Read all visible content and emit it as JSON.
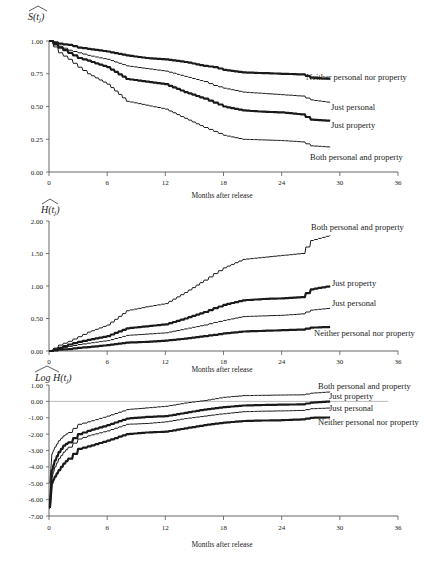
{
  "chart_data": [
    {
      "type": "line",
      "title": "",
      "ylabel": "S(t_j) hat",
      "xlabel": "Months after release",
      "xlim": [
        0,
        36
      ],
      "ylim": [
        0,
        1
      ],
      "xticks": [
        0,
        6,
        12,
        18,
        24,
        30,
        36
      ],
      "yticks": [
        0.0,
        0.25,
        0.5,
        0.75,
        1.0
      ],
      "ytick_labels": [
        "0.00",
        "0.25",
        "0.50",
        "0.75",
        "1.00"
      ],
      "grid": false,
      "legend": "inline labels at line ends",
      "series": [
        {
          "name": "Neither personal nor property",
          "weight": "thick",
          "x": [
            0,
            1,
            2,
            3,
            4,
            6,
            8,
            10,
            12,
            14,
            16,
            17,
            18,
            20,
            22,
            24,
            26,
            27,
            29
          ],
          "y": [
            1.0,
            0.98,
            0.97,
            0.95,
            0.94,
            0.92,
            0.89,
            0.87,
            0.86,
            0.84,
            0.81,
            0.8,
            0.78,
            0.76,
            0.755,
            0.75,
            0.745,
            0.72,
            0.71
          ]
        },
        {
          "name": "Just personal",
          "weight": "thin",
          "x": [
            0,
            1,
            2,
            3,
            4,
            6,
            8,
            10,
            12,
            14,
            16,
            17,
            18,
            20,
            22,
            24,
            26,
            27,
            29
          ],
          "y": [
            1.0,
            0.96,
            0.93,
            0.91,
            0.89,
            0.86,
            0.81,
            0.79,
            0.77,
            0.73,
            0.69,
            0.66,
            0.64,
            0.61,
            0.6,
            0.59,
            0.58,
            0.55,
            0.53
          ]
        },
        {
          "name": "Just property",
          "weight": "thick",
          "x": [
            0,
            1,
            2,
            3,
            4,
            6,
            8,
            10,
            12,
            14,
            16,
            17,
            18,
            20,
            22,
            24,
            26,
            27,
            29
          ],
          "y": [
            1.0,
            0.95,
            0.91,
            0.87,
            0.85,
            0.8,
            0.71,
            0.69,
            0.67,
            0.61,
            0.56,
            0.53,
            0.5,
            0.47,
            0.46,
            0.455,
            0.44,
            0.4,
            0.39
          ]
        },
        {
          "name": "Both personal and property",
          "weight": "thin",
          "x": [
            0,
            1,
            2,
            3,
            4,
            6,
            8,
            10,
            12,
            14,
            16,
            17,
            18,
            20,
            22,
            24,
            26,
            27,
            29
          ],
          "y": [
            1.0,
            0.91,
            0.86,
            0.8,
            0.75,
            0.67,
            0.54,
            0.51,
            0.48,
            0.41,
            0.34,
            0.31,
            0.28,
            0.25,
            0.245,
            0.24,
            0.23,
            0.2,
            0.19
          ]
        }
      ]
    },
    {
      "type": "line",
      "title": "",
      "ylabel": "H(t_j) hat",
      "xlabel": "Months after release",
      "xlim": [
        0,
        36
      ],
      "ylim": [
        0,
        2
      ],
      "xticks": [
        0,
        6,
        12,
        18,
        24,
        30,
        36
      ],
      "yticks": [
        0.0,
        0.5,
        1.0,
        1.5,
        2.0
      ],
      "ytick_labels": [
        "0.00",
        "0.50",
        "1.00",
        "1.50",
        "2.00"
      ],
      "grid": false,
      "legend": "inline labels at line ends",
      "series": [
        {
          "name": "Both personal and property",
          "weight": "thin",
          "x": [
            0,
            1,
            2,
            3,
            4,
            6,
            8,
            10,
            12,
            14,
            16,
            17,
            18,
            20,
            22,
            24,
            26,
            27,
            29
          ],
          "y": [
            0.0,
            0.09,
            0.15,
            0.22,
            0.29,
            0.4,
            0.62,
            0.68,
            0.73,
            0.9,
            1.09,
            1.19,
            1.28,
            1.41,
            1.44,
            1.47,
            1.5,
            1.7,
            1.78
          ]
        },
        {
          "name": "Just property",
          "weight": "thick",
          "x": [
            0,
            1,
            2,
            3,
            4,
            6,
            8,
            10,
            12,
            14,
            16,
            17,
            18,
            20,
            22,
            24,
            26,
            27,
            29
          ],
          "y": [
            0.0,
            0.05,
            0.1,
            0.14,
            0.17,
            0.23,
            0.35,
            0.38,
            0.41,
            0.5,
            0.6,
            0.66,
            0.71,
            0.78,
            0.8,
            0.81,
            0.83,
            0.95,
            1.0
          ]
        },
        {
          "name": "Just personal",
          "weight": "thin",
          "x": [
            0,
            1,
            2,
            3,
            4,
            6,
            8,
            10,
            12,
            14,
            16,
            17,
            18,
            20,
            22,
            24,
            26,
            27,
            29
          ],
          "y": [
            0.0,
            0.04,
            0.07,
            0.1,
            0.12,
            0.16,
            0.24,
            0.26,
            0.28,
            0.34,
            0.4,
            0.44,
            0.47,
            0.53,
            0.54,
            0.55,
            0.57,
            0.63,
            0.66
          ]
        },
        {
          "name": "Neither personal nor property",
          "weight": "thick",
          "x": [
            0,
            1,
            2,
            3,
            4,
            6,
            8,
            10,
            12,
            14,
            16,
            17,
            18,
            20,
            22,
            24,
            26,
            27,
            29
          ],
          "y": [
            0.0,
            0.02,
            0.03,
            0.05,
            0.06,
            0.09,
            0.13,
            0.14,
            0.16,
            0.19,
            0.23,
            0.25,
            0.27,
            0.3,
            0.31,
            0.32,
            0.33,
            0.36,
            0.37
          ]
        }
      ]
    },
    {
      "type": "line",
      "title": "",
      "ylabel": "Log H(t_j) hat",
      "xlabel": "Months after release",
      "xlim": [
        0,
        36
      ],
      "ylim": [
        -7,
        1
      ],
      "xticks": [
        0,
        6,
        12,
        18,
        24,
        30,
        36
      ],
      "yticks": [
        -7,
        -6,
        -5,
        -4,
        -3,
        -2,
        -1,
        0,
        1
      ],
      "ytick_labels": [
        "-7.00",
        "-6.00",
        "-5.00",
        "-4.00",
        "-3.00",
        "-2.00",
        "-1.00",
        "0.00",
        "1.00"
      ],
      "reference_line": 0,
      "grid": false,
      "legend": "inline labels at line ends",
      "series": [
        {
          "name": "Both personal and property",
          "weight": "thin",
          "x": [
            0.1,
            0.3,
            0.6,
            1,
            1.5,
            2,
            3,
            4,
            6,
            8,
            10,
            12,
            14,
            16,
            18,
            20,
            22,
            24,
            26,
            27,
            29
          ],
          "y": [
            -5.0,
            -3.2,
            -2.8,
            -2.4,
            -2.1,
            -1.9,
            -1.4,
            -1.25,
            -0.9,
            -0.5,
            -0.4,
            -0.3,
            -0.1,
            0.05,
            0.25,
            0.35,
            0.37,
            0.39,
            0.4,
            0.5,
            0.58
          ]
        },
        {
          "name": "Just property",
          "weight": "thick",
          "x": [
            0.1,
            0.3,
            0.6,
            1,
            1.5,
            2,
            3,
            4,
            6,
            8,
            10,
            12,
            14,
            16,
            18,
            20,
            22,
            24,
            26,
            27,
            29
          ],
          "y": [
            -6.4,
            -4.2,
            -3.6,
            -3.1,
            -2.7,
            -2.5,
            -2.0,
            -1.8,
            -1.45,
            -1.05,
            -0.95,
            -0.9,
            -0.7,
            -0.5,
            -0.35,
            -0.25,
            -0.22,
            -0.2,
            -0.18,
            -0.08,
            0.0
          ]
        },
        {
          "name": "Just personal",
          "weight": "thin",
          "x": [
            0.1,
            0.3,
            0.6,
            1,
            1.5,
            2,
            3,
            4,
            6,
            8,
            10,
            12,
            14,
            16,
            18,
            20,
            22,
            24,
            26,
            27,
            29
          ],
          "y": [
            -6.2,
            -4.6,
            -4.0,
            -3.5,
            -3.1,
            -2.8,
            -2.3,
            -2.1,
            -1.8,
            -1.4,
            -1.35,
            -1.25,
            -1.05,
            -0.9,
            -0.75,
            -0.63,
            -0.6,
            -0.58,
            -0.55,
            -0.45,
            -0.4
          ]
        },
        {
          "name": "Neither personal nor property",
          "weight": "thick",
          "x": [
            0.1,
            0.3,
            0.6,
            1,
            1.5,
            2,
            3,
            4,
            6,
            8,
            10,
            12,
            14,
            16,
            18,
            20,
            22,
            24,
            26,
            27,
            29
          ],
          "y": [
            -6.5,
            -5.0,
            -4.6,
            -4.2,
            -3.8,
            -3.5,
            -2.9,
            -2.75,
            -2.4,
            -2.0,
            -1.9,
            -1.85,
            -1.65,
            -1.45,
            -1.3,
            -1.2,
            -1.17,
            -1.15,
            -1.1,
            -1.0,
            -0.98
          ]
        }
      ]
    }
  ],
  "labels": {
    "chart1": {
      "ylabel": "S(t",
      "ylabel_sub": "j",
      "ylabel_end": ")",
      "xlabel": "Months after release",
      "series_labels": [
        "Neither personal nor property",
        "Just personal",
        "Just property",
        "Both personal and property"
      ]
    },
    "chart2": {
      "ylabel": "H(t",
      "ylabel_sub": "j",
      "ylabel_end": ")",
      "xlabel": "Months after release",
      "series_labels": [
        "Both personal and property",
        "Just property",
        "Just personal",
        "Neither personal nor property"
      ]
    },
    "chart3": {
      "ylabel": "Log H(t",
      "ylabel_sub": "j",
      "ylabel_end": ")",
      "xlabel": "Months after release",
      "series_labels": [
        "Both personal and property",
        "Just property",
        "Just personal",
        "Neither personal nor property"
      ]
    }
  },
  "style": {
    "axis_color": "#555555",
    "line_color": "#1a1a1a",
    "thick_width": 2.2,
    "thin_width": 1.0,
    "text_color": "#222222"
  }
}
